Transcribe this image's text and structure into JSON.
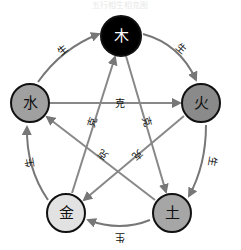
{
  "diagram": {
    "title": "五行相生相克图",
    "colors": {
      "edge": "#777777",
      "node_stroke": "#111111",
      "wood_fill": "#000000",
      "wood_text": "#ffffff",
      "fire_fill": "#8a8a8a",
      "earth_fill": "#a6a6a6",
      "metal_fill": "#e2e2e2",
      "water_fill": "#a0a0a0",
      "dark_text": "#111111"
    },
    "nodes": [
      {
        "id": "wood",
        "label": "木",
        "cx": 121,
        "cy": 36
      },
      {
        "id": "fire",
        "label": "火",
        "cx": 201,
        "cy": 103
      },
      {
        "id": "earth",
        "label": "土",
        "cx": 172,
        "cy": 213
      },
      {
        "id": "metal",
        "label": "金",
        "cx": 66,
        "cy": 213
      },
      {
        "id": "water",
        "label": "水",
        "cx": 30,
        "cy": 103
      }
    ],
    "generating_cycle": {
      "label": "生",
      "edges": [
        {
          "from": "wood",
          "to": "fire",
          "label": "生"
        },
        {
          "from": "fire",
          "to": "earth",
          "label": "生"
        },
        {
          "from": "earth",
          "to": "metal",
          "label": "生"
        },
        {
          "from": "metal",
          "to": "water",
          "label": "生"
        },
        {
          "from": "water",
          "to": "wood",
          "label": "生"
        }
      ]
    },
    "restraining_cycle": {
      "label": "克",
      "edges": [
        {
          "from": "wood",
          "to": "earth",
          "label": "克"
        },
        {
          "from": "earth",
          "to": "water",
          "label": "克"
        },
        {
          "from": "water",
          "to": "fire",
          "label": "克"
        },
        {
          "from": "fire",
          "to": "metal",
          "label": "克"
        },
        {
          "from": "metal",
          "to": "wood",
          "label": "克"
        }
      ]
    }
  }
}
